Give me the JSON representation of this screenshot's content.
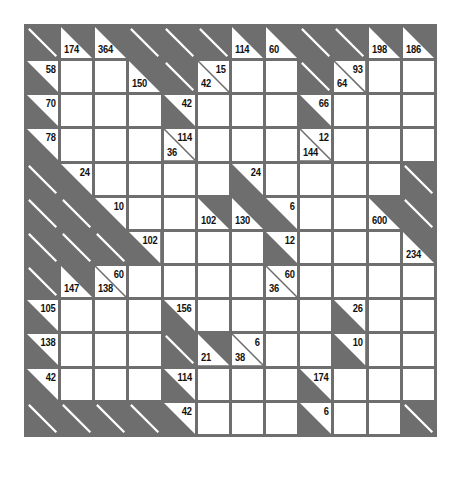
{
  "puzzle": {
    "type": "kakuro",
    "rows": 12,
    "cols": 12,
    "colors": {
      "grid": "#6e6e6e",
      "white": "#ffffff",
      "text": "#111111"
    },
    "legend": {
      "B": "blank block",
      "W": "entry cell",
      "R": "across clue only",
      "D": "down clue only",
      "RD": "across and down clue"
    },
    "grid": [
      [
        {
          "t": "B"
        },
        {
          "t": "D",
          "down": "174"
        },
        {
          "t": "D",
          "down": "364"
        },
        {
          "t": "B"
        },
        {
          "t": "B"
        },
        {
          "t": "B"
        },
        {
          "t": "D",
          "down": "114"
        },
        {
          "t": "D",
          "down": "60"
        },
        {
          "t": "B"
        },
        {
          "t": "B"
        },
        {
          "t": "D",
          "down": "198"
        },
        {
          "t": "D",
          "down": "186"
        }
      ],
      [
        {
          "t": "R",
          "right": "58"
        },
        {
          "t": "W"
        },
        {
          "t": "W"
        },
        {
          "t": "D",
          "down": "150"
        },
        {
          "t": "B"
        },
        {
          "t": "RD",
          "right": "15",
          "down": "42"
        },
        {
          "t": "W"
        },
        {
          "t": "W"
        },
        {
          "t": "B"
        },
        {
          "t": "RD",
          "right": "93",
          "down": "64"
        },
        {
          "t": "W"
        },
        {
          "t": "W"
        }
      ],
      [
        {
          "t": "R",
          "right": "70"
        },
        {
          "t": "W"
        },
        {
          "t": "W"
        },
        {
          "t": "W"
        },
        {
          "t": "R",
          "right": "42"
        },
        {
          "t": "W"
        },
        {
          "t": "W"
        },
        {
          "t": "W"
        },
        {
          "t": "R",
          "right": "66"
        },
        {
          "t": "W"
        },
        {
          "t": "W"
        },
        {
          "t": "W"
        }
      ],
      [
        {
          "t": "R",
          "right": "78"
        },
        {
          "t": "W"
        },
        {
          "t": "W"
        },
        {
          "t": "W"
        },
        {
          "t": "RD",
          "right": "114",
          "down": "36"
        },
        {
          "t": "W"
        },
        {
          "t": "W"
        },
        {
          "t": "W"
        },
        {
          "t": "RD",
          "right": "12",
          "down": "144"
        },
        {
          "t": "W"
        },
        {
          "t": "W"
        },
        {
          "t": "W"
        }
      ],
      [
        {
          "t": "B"
        },
        {
          "t": "R",
          "right": "24"
        },
        {
          "t": "W"
        },
        {
          "t": "W"
        },
        {
          "t": "W"
        },
        {
          "t": "W"
        },
        {
          "t": "R",
          "right": "24"
        },
        {
          "t": "W"
        },
        {
          "t": "W"
        },
        {
          "t": "W"
        },
        {
          "t": "W"
        },
        {
          "t": "B"
        }
      ],
      [
        {
          "t": "B"
        },
        {
          "t": "B"
        },
        {
          "t": "R",
          "right": "10"
        },
        {
          "t": "W"
        },
        {
          "t": "W"
        },
        {
          "t": "D",
          "down": "102"
        },
        {
          "t": "D",
          "down": "130"
        },
        {
          "t": "R",
          "right": "6"
        },
        {
          "t": "W"
        },
        {
          "t": "W"
        },
        {
          "t": "D",
          "down": "600"
        },
        {
          "t": "B"
        }
      ],
      [
        {
          "t": "B"
        },
        {
          "t": "B"
        },
        {
          "t": "B"
        },
        {
          "t": "R",
          "right": "102"
        },
        {
          "t": "W"
        },
        {
          "t": "W"
        },
        {
          "t": "W"
        },
        {
          "t": "R",
          "right": "12"
        },
        {
          "t": "W"
        },
        {
          "t": "W"
        },
        {
          "t": "W"
        },
        {
          "t": "D",
          "down": "234"
        }
      ],
      [
        {
          "t": "B"
        },
        {
          "t": "D",
          "down": "147"
        },
        {
          "t": "RD",
          "right": "60",
          "down": "138"
        },
        {
          "t": "W"
        },
        {
          "t": "W"
        },
        {
          "t": "W"
        },
        {
          "t": "W"
        },
        {
          "t": "RD",
          "right": "60",
          "down": "36"
        },
        {
          "t": "W"
        },
        {
          "t": "W"
        },
        {
          "t": "W"
        },
        {
          "t": "W"
        }
      ],
      [
        {
          "t": "R",
          "right": "105"
        },
        {
          "t": "W"
        },
        {
          "t": "W"
        },
        {
          "t": "W"
        },
        {
          "t": "R",
          "right": "156"
        },
        {
          "t": "W"
        },
        {
          "t": "W"
        },
        {
          "t": "W"
        },
        {
          "t": "W"
        },
        {
          "t": "R",
          "right": "26"
        },
        {
          "t": "W"
        },
        {
          "t": "W"
        }
      ],
      [
        {
          "t": "R",
          "right": "138"
        },
        {
          "t": "W"
        },
        {
          "t": "W"
        },
        {
          "t": "W"
        },
        {
          "t": "B"
        },
        {
          "t": "D",
          "down": "21"
        },
        {
          "t": "RD",
          "right": "6",
          "down": "38"
        },
        {
          "t": "W"
        },
        {
          "t": "W"
        },
        {
          "t": "R",
          "right": "10"
        },
        {
          "t": "W"
        },
        {
          "t": "W"
        }
      ],
      [
        {
          "t": "R",
          "right": "42"
        },
        {
          "t": "W"
        },
        {
          "t": "W"
        },
        {
          "t": "W"
        },
        {
          "t": "R",
          "right": "114"
        },
        {
          "t": "W"
        },
        {
          "t": "W"
        },
        {
          "t": "W"
        },
        {
          "t": "R",
          "right": "174"
        },
        {
          "t": "W"
        },
        {
          "t": "W"
        },
        {
          "t": "W"
        }
      ],
      [
        {
          "t": "B"
        },
        {
          "t": "B"
        },
        {
          "t": "B"
        },
        {
          "t": "B"
        },
        {
          "t": "R",
          "right": "42"
        },
        {
          "t": "W"
        },
        {
          "t": "W"
        },
        {
          "t": "W"
        },
        {
          "t": "R",
          "right": "6"
        },
        {
          "t": "W"
        },
        {
          "t": "W"
        },
        {
          "t": "B"
        }
      ]
    ]
  }
}
